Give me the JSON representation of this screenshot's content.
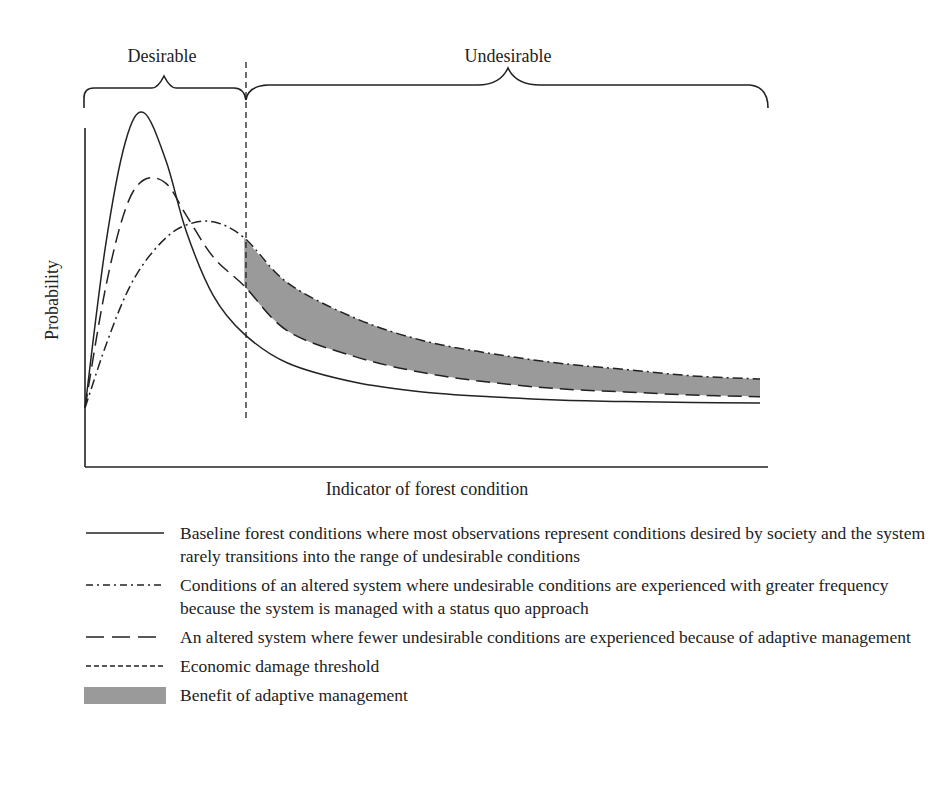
{
  "chart_data": {
    "type": "line",
    "title": "",
    "xlabel": "Indicator of forest condition",
    "ylabel": "Probability",
    "grid": false,
    "ticks": "none",
    "region_labels": [
      "Desirable",
      "Undesirable"
    ],
    "threshold_x": 0.236,
    "legend_position": "bottom",
    "x": [
      0,
      0.03,
      0.06,
      0.087,
      0.12,
      0.15,
      0.19,
      0.236,
      0.3,
      0.4,
      0.5,
      0.6,
      0.7,
      0.8,
      0.9,
      1.0
    ],
    "series": [
      {
        "name": "Baseline forest conditions",
        "style": "solid",
        "values": [
          0.05,
          0.55,
          0.88,
          0.97,
          0.82,
          0.6,
          0.4,
          0.28,
          0.19,
          0.13,
          0.1,
          0.085,
          0.075,
          0.07,
          0.067,
          0.065
        ]
      },
      {
        "name": "Adaptive management",
        "style": "dashed",
        "values": [
          0.05,
          0.42,
          0.67,
          0.76,
          0.75,
          0.65,
          0.52,
          0.43,
          0.29,
          0.21,
          0.16,
          0.13,
          0.11,
          0.1,
          0.09,
          0.085
        ]
      },
      {
        "name": "Status quo management",
        "style": "dash-dot",
        "values": [
          0.05,
          0.24,
          0.4,
          0.5,
          0.58,
          0.62,
          0.63,
          0.58,
          0.44,
          0.33,
          0.26,
          0.22,
          0.19,
          0.17,
          0.15,
          0.14
        ]
      }
    ],
    "shaded_area": {
      "name": "Benefit of adaptive management",
      "between": [
        "Status quo management",
        "Adaptive management"
      ],
      "x_from": 0.236,
      "x_to": 1.0,
      "color": "#9a9a9a"
    }
  },
  "axes": {
    "xlabel": "Indicator of forest condition",
    "ylabel": "Probability"
  },
  "regions": {
    "desirable": "Desirable",
    "undesirable": "Undesirable"
  },
  "legend": [
    {
      "key": "solid",
      "text": "Baseline forest conditions where most observations represent conditions desired by society and the system rarely transitions into the range of undesirable conditions"
    },
    {
      "key": "dash-dot",
      "text": "Conditions of an altered system where undesirable conditions are experienced with greater frequency because the system is managed with a status quo approach"
    },
    {
      "key": "long-dash",
      "text": "An altered system where fewer undesirable conditions are experienced because of adaptive management"
    },
    {
      "key": "short-dash",
      "text": "Economic damage threshold"
    },
    {
      "key": "fill",
      "text": "Benefit of adaptive management"
    }
  ],
  "colors": {
    "ink": "#222222",
    "fill": "#9a9a9a"
  }
}
